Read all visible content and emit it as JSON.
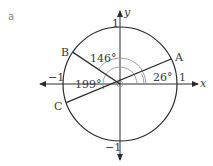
{
  "part_label": "a",
  "axes": {
    "x_label": "x",
    "y_label": "y",
    "x_pos_tick": "1",
    "x_neg_tick": "−1",
    "y_pos_tick": "1",
    "y_neg_tick": "−1"
  },
  "unit_circle": {
    "radius": 1
  },
  "points": [
    {
      "name": "A",
      "angle_deg": 26
    },
    {
      "name": "B",
      "angle_deg": 146
    },
    {
      "name": "C",
      "angle_deg": 199
    }
  ],
  "angle_labels": [
    {
      "label": "26°",
      "angle_deg": 26
    },
    {
      "label": "146°",
      "angle_deg": 146
    },
    {
      "label": "199°",
      "angle_deg": 199
    }
  ],
  "colors": {
    "line": "#2b2b2b",
    "arc": "#9a9a9a",
    "text": "#3a3a3a"
  }
}
